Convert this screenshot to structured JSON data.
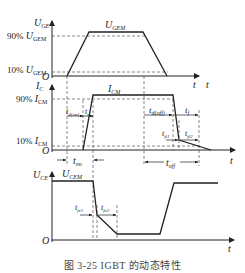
{
  "figure": {
    "caption": "图 3-25   IGBT 的动态特性",
    "panels": [
      {
        "name": "gate-voltage",
        "y_label_main": "U",
        "y_label_sub": "GE",
        "x_label": "t",
        "origin": "O",
        "peak_label_main": "U",
        "peak_label_sub": "GEM",
        "level_90_prefix": "90% ",
        "level_90_main": "U",
        "level_90_sub": "GEM",
        "level_10_prefix": "10% ",
        "level_10_main": "U",
        "level_10_sub": "GEM"
      },
      {
        "name": "collector-current",
        "y_label_main": "I",
        "y_label_sub": "C",
        "x_label": "t",
        "origin": "O",
        "peak_label_main": "I",
        "peak_label_sub": "CM",
        "level_90_prefix": "90% ",
        "level_90_main": "I",
        "level_90_sub": "CM",
        "level_10_prefix": "10% ",
        "level_10_main": "I",
        "level_10_sub": "CM",
        "intervals": {
          "td_on_main": "t",
          "td_on_sub": "d(on)",
          "tr_main": "t",
          "tr_sub": "r",
          "ton_main": "t",
          "ton_sub": "on",
          "td_off_main": "t",
          "td_off_sub": "d(off)",
          "tf_main": "t",
          "tf_sub": "f",
          "tfi1_main": "t",
          "tfi1_sub": "fi1",
          "tfi2_main": "t",
          "tfi2_sub": "fi2",
          "toff_main": "t",
          "toff_sub": "off"
        }
      },
      {
        "name": "collector-emitter-voltage",
        "y_label_main": "U",
        "y_label_sub": "CE",
        "x_label": "t",
        "origin": "O",
        "peak_label_main": "U",
        "peak_label_sub": "CEM",
        "intervals": {
          "tfv1_main": "t",
          "tfv1_sub": "fv1",
          "tfv2_main": "t",
          "tfv2_sub": "fv2"
        }
      }
    ]
  },
  "colors": {
    "line": "#222222",
    "dash": "#555555",
    "caption": "#444444"
  }
}
